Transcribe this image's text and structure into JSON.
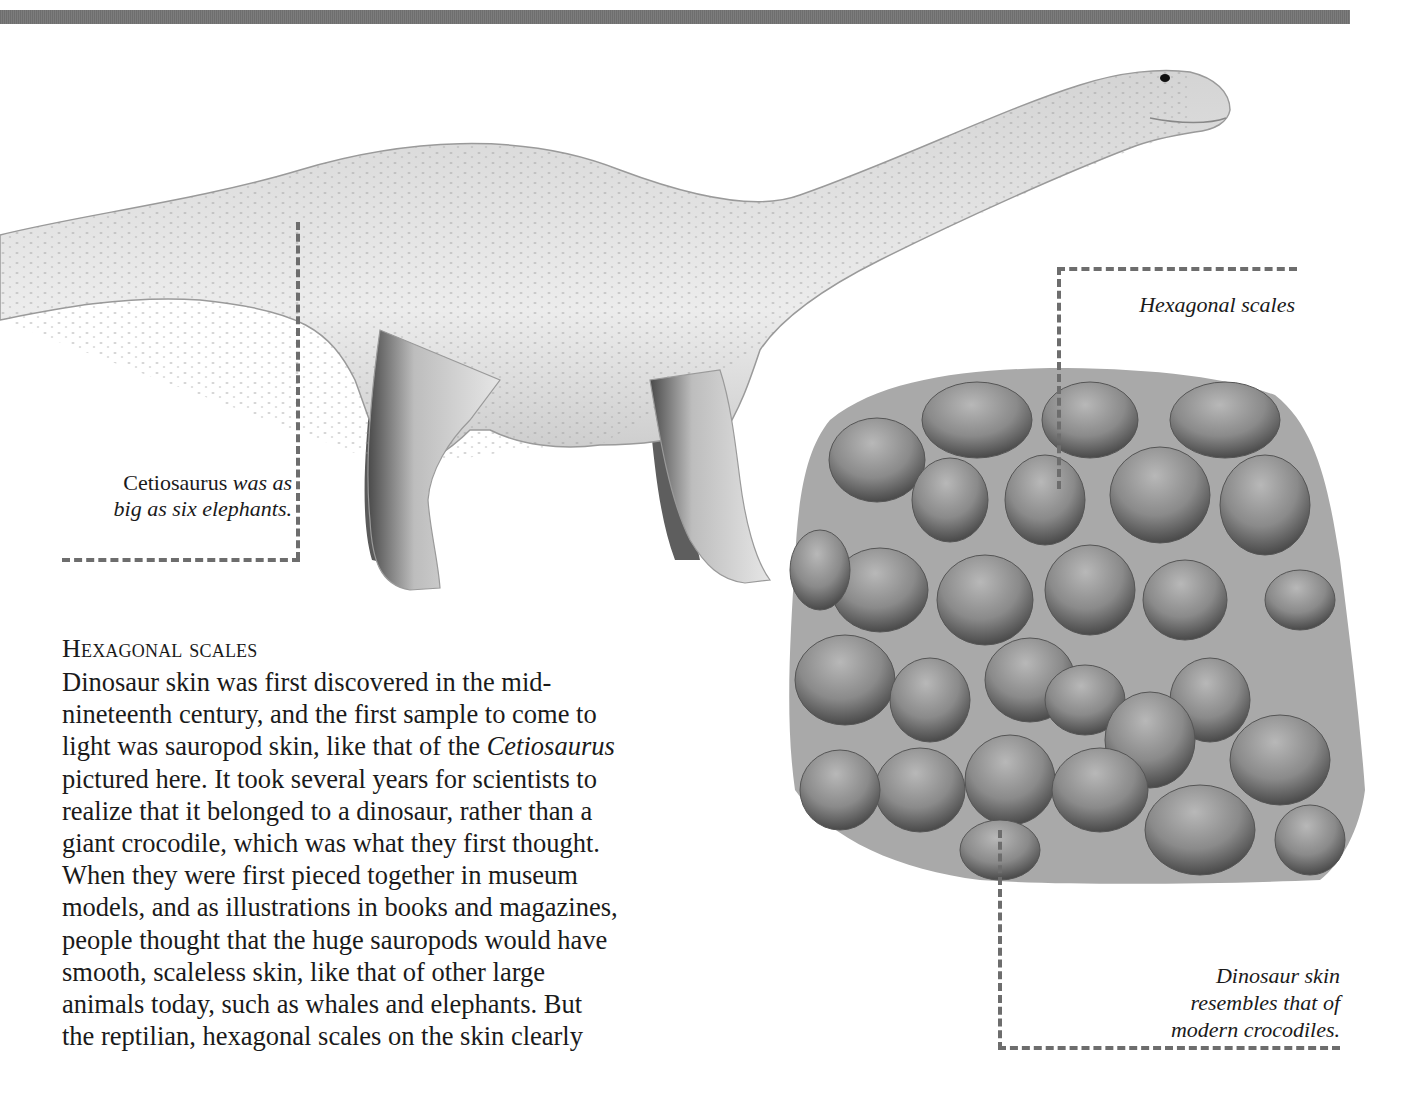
{
  "page": {
    "colors": {
      "top_bar": "#757575",
      "leader_lines": "#6d6d6d",
      "text": "#1a1a1a",
      "background": "#ffffff"
    }
  },
  "illustrations": {
    "dinosaur": {
      "subject": "Cetiosaurus",
      "icon": "sauropod-illustration"
    },
    "skin_patch": {
      "subject": "Dinosaur skin with hexagonal scales",
      "icon": "scaly-skin-illustration"
    }
  },
  "captions": {
    "cetiosaurus": {
      "name": "Cetiosaurus",
      "rest_line1": " was as",
      "line2": "big as six elephants."
    },
    "hexagonal_scales": "Hexagonal scales",
    "dinosaur_skin": {
      "line1": "Dinosaur skin",
      "line2": "resembles that of",
      "line3": "modern crocodiles."
    }
  },
  "article": {
    "heading": "Hexagonal scales",
    "lines": [
      "Dinosaur skin was first discovered in the mid-",
      "nineteenth century, and the first sample to come to",
      "light was sauropod skin, like that of the ",
      "pictured here. It took several years for scientists to",
      "realize that it belonged to a dinosaur, rather than a",
      "giant crocodile, which was what they first thought.",
      "When they were first pieced together in museum",
      "models, and as illustrations in books and magazines,",
      "people thought that the huge sauropods would have",
      "smooth, scaleless skin, like that of other large",
      "animals today, such as whales and elephants. But",
      "the reptilian, hexagonal scales on the skin clearly"
    ],
    "italic_term": "Cetiosaurus"
  }
}
